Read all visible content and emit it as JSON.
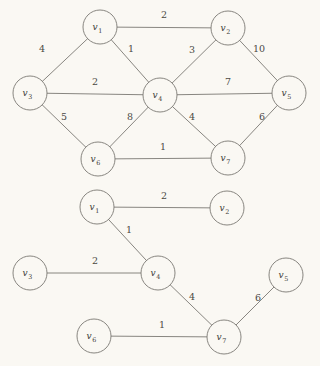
{
  "figure": {
    "background_color": "#faf8f3",
    "line_color": "#7a7873",
    "text_color": "#3b3a36",
    "width": 320,
    "height": 366
  },
  "graphs": [
    {
      "id": "weighted-graph",
      "caption": "",
      "nodes": [
        {
          "id": "v1",
          "label": "v",
          "subscript": "1",
          "x": 100,
          "y": 27,
          "r": 17
        },
        {
          "id": "v2",
          "label": "v",
          "subscript": "2",
          "x": 228,
          "y": 28,
          "r": 17
        },
        {
          "id": "v3",
          "label": "v",
          "subscript": "3",
          "x": 30,
          "y": 93,
          "r": 17
        },
        {
          "id": "v4",
          "label": "v",
          "subscript": "4",
          "x": 160,
          "y": 95,
          "r": 17
        },
        {
          "id": "v5",
          "label": "v",
          "subscript": "5",
          "x": 289,
          "y": 93,
          "r": 17
        },
        {
          "id": "v6",
          "label": "v",
          "subscript": "6",
          "x": 98,
          "y": 159,
          "r": 17
        },
        {
          "id": "v7",
          "label": "v",
          "subscript": "7",
          "x": 228,
          "y": 158,
          "r": 17
        }
      ],
      "edges": [
        {
          "from": "v1",
          "to": "v2",
          "weight": "2",
          "lx": 164,
          "ly": 18
        },
        {
          "from": "v1",
          "to": "v3",
          "weight": "4",
          "lx": 42,
          "ly": 52
        },
        {
          "from": "v1",
          "to": "v4",
          "weight": "1",
          "lx": 131,
          "ly": 52
        },
        {
          "from": "v2",
          "to": "v4",
          "weight": "3",
          "lx": 192,
          "ly": 53
        },
        {
          "from": "v2",
          "to": "v5",
          "weight": "10",
          "lx": 259,
          "ly": 52
        },
        {
          "from": "v3",
          "to": "v4",
          "weight": "2",
          "lx": 95,
          "ly": 85
        },
        {
          "from": "v4",
          "to": "v5",
          "weight": "7",
          "lx": 228,
          "ly": 85
        },
        {
          "from": "v3",
          "to": "v6",
          "weight": "5",
          "lx": 64,
          "ly": 120
        },
        {
          "from": "v4",
          "to": "v6",
          "weight": "8",
          "lx": 130,
          "ly": 120
        },
        {
          "from": "v4",
          "to": "v7",
          "weight": "4",
          "lx": 192,
          "ly": 120
        },
        {
          "from": "v5",
          "to": "v7",
          "weight": "6",
          "lx": 262,
          "ly": 120
        },
        {
          "from": "v6",
          "to": "v7",
          "weight": "1",
          "lx": 163,
          "ly": 150
        }
      ]
    },
    {
      "id": "minimum-spanning-tree",
      "caption": "",
      "nodes": [
        {
          "id": "v1",
          "label": "v",
          "subscript": "1",
          "x": 97,
          "y": 207,
          "r": 17
        },
        {
          "id": "v2",
          "label": "v",
          "subscript": "2",
          "x": 227,
          "y": 208,
          "r": 17
        },
        {
          "id": "v3",
          "label": "v",
          "subscript": "3",
          "x": 30,
          "y": 273,
          "r": 17
        },
        {
          "id": "v4",
          "label": "v",
          "subscript": "4",
          "x": 158,
          "y": 273,
          "r": 17
        },
        {
          "id": "v5",
          "label": "v",
          "subscript": "5",
          "x": 286,
          "y": 275,
          "r": 17
        },
        {
          "id": "v6",
          "label": "v",
          "subscript": "6",
          "x": 94,
          "y": 336,
          "r": 17
        },
        {
          "id": "v7",
          "label": "v",
          "subscript": "7",
          "x": 224,
          "y": 337,
          "r": 17
        }
      ],
      "edges": [
        {
          "from": "v1",
          "to": "v2",
          "weight": "2",
          "lx": 164,
          "ly": 199
        },
        {
          "from": "v1",
          "to": "v4",
          "weight": "1",
          "lx": 129,
          "ly": 233
        },
        {
          "from": "v3",
          "to": "v4",
          "weight": "2",
          "lx": 95,
          "ly": 264
        },
        {
          "from": "v4",
          "to": "v7",
          "weight": "4",
          "lx": 192,
          "ly": 300
        },
        {
          "from": "v5",
          "to": "v7",
          "weight": "6",
          "lx": 258,
          "ly": 301
        },
        {
          "from": "v6",
          "to": "v7",
          "weight": "1",
          "lx": 162,
          "ly": 328
        }
      ]
    }
  ]
}
